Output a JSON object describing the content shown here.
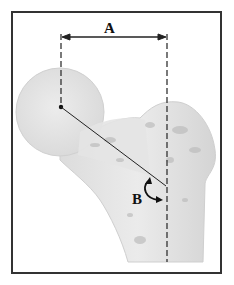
{
  "figure": {
    "labels": {
      "a": "A",
      "b": "B"
    },
    "annotations": [
      {
        "id": "A",
        "type": "horizontal-distance-arrow",
        "description": "distance between femoral head center and femoral shaft axis"
      },
      {
        "id": "B",
        "type": "curved-angle-arrow",
        "description": "angle between femoral neck axis and shaft axis"
      }
    ],
    "colors": {
      "bone_fill": "#e6e6e6",
      "bone_shadow": "#c8c8c8",
      "line": "#222222",
      "frame": "#333333"
    }
  }
}
